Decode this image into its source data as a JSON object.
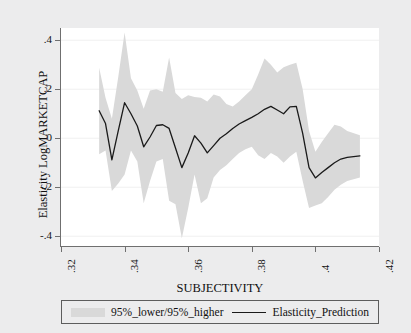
{
  "chart_data": {
    "type": "line",
    "title": "",
    "xlabel": "SUBJECTIVITY",
    "ylabel": "Elasticity LogMARKETCAP",
    "xlim": [
      0.32,
      0.42
    ],
    "ylim": [
      -0.44,
      0.45
    ],
    "xticks": [
      ".32",
      ".34",
      ".36",
      ".38",
      ".4",
      ".42"
    ],
    "xtick_values": [
      0.32,
      0.34,
      0.36,
      0.38,
      0.4,
      0.42
    ],
    "yticks": [
      ".4",
      ".2",
      "0",
      "-.2",
      "-.4"
    ],
    "ytick_values": [
      0.4,
      0.2,
      0,
      -0.2,
      -0.4
    ],
    "grid": true,
    "legend_position": "below",
    "x": [
      0.332,
      0.334,
      0.336,
      0.338,
      0.34,
      0.342,
      0.344,
      0.346,
      0.348,
      0.35,
      0.352,
      0.354,
      0.356,
      0.358,
      0.36,
      0.362,
      0.364,
      0.366,
      0.368,
      0.37,
      0.372,
      0.374,
      0.376,
      0.378,
      0.38,
      0.382,
      0.384,
      0.386,
      0.388,
      0.39,
      0.392,
      0.394,
      0.396,
      0.398,
      0.4,
      0.402,
      0.404,
      0.406,
      0.408,
      0.41,
      0.414
    ],
    "series": [
      {
        "name": "Elasticity_Prediction",
        "color": "#1a1a1a",
        "values": [
          0.112,
          0.06,
          -0.088,
          0.03,
          0.145,
          0.1,
          0.05,
          -0.035,
          0.005,
          0.052,
          0.055,
          0.04,
          -0.04,
          -0.12,
          -0.06,
          0.01,
          -0.02,
          -0.06,
          -0.03,
          0.0,
          0.018,
          0.04,
          0.058,
          0.072,
          0.085,
          0.1,
          0.118,
          0.13,
          0.115,
          0.1,
          0.128,
          0.13,
          0.02,
          -0.12,
          -0.162,
          -0.14,
          -0.12,
          -0.1,
          -0.085,
          -0.078,
          -0.072
        ]
      },
      {
        "name": "95%_higher",
        "color": "#d9d9d9",
        "values": [
          0.288,
          0.165,
          0.08,
          0.25,
          0.432,
          0.245,
          0.195,
          0.12,
          0.195,
          0.2,
          0.19,
          0.33,
          0.185,
          0.16,
          0.175,
          0.168,
          0.165,
          0.15,
          0.178,
          0.17,
          0.14,
          0.13,
          0.15,
          0.175,
          0.2,
          0.26,
          0.325,
          0.3,
          0.268,
          0.29,
          0.3,
          0.308,
          0.2,
          0.03,
          -0.055,
          -0.015,
          0.02,
          0.055,
          0.048,
          0.03,
          0.012
        ]
      },
      {
        "name": "95%_lower",
        "color": "#d9d9d9",
        "values": [
          -0.065,
          -0.05,
          -0.215,
          -0.185,
          -0.148,
          -0.05,
          -0.095,
          -0.265,
          -0.175,
          -0.095,
          -0.085,
          -0.255,
          -0.27,
          -0.408,
          -0.285,
          -0.148,
          -0.265,
          -0.245,
          -0.16,
          -0.13,
          -0.11,
          -0.085,
          -0.06,
          -0.045,
          -0.035,
          -0.07,
          -0.085,
          -0.06,
          -0.075,
          -0.1,
          -0.075,
          -0.055,
          -0.175,
          -0.285,
          -0.275,
          -0.265,
          -0.24,
          -0.21,
          -0.19,
          -0.175,
          -0.16
        ]
      }
    ]
  },
  "axes": {
    "y_title": "Elasticity LogMARKETCAP",
    "x_title": "SUBJECTIVITY",
    "y_tick_labels": [
      ".4",
      ".2",
      "0",
      "-.2",
      "-.4"
    ],
    "x_tick_labels": [
      ".32",
      ".34",
      ".36",
      ".38",
      ".4",
      ".42"
    ]
  },
  "legend": {
    "band_label": "95%_lower/95%_higher",
    "line_label": "Elasticity_Prediction"
  },
  "colors": {
    "band": "#d9d9d9",
    "line": "#1a1a1a",
    "plot_background": "#ffffff",
    "figure_background": "#ececed",
    "axis": "#6f6f6f",
    "grid": "#f0f0f0"
  }
}
